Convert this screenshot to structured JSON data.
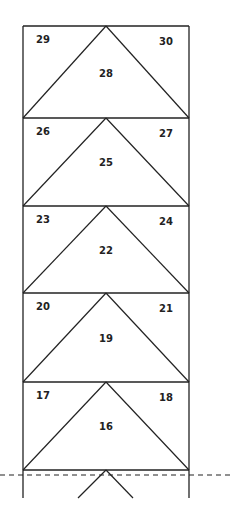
{
  "diagram": {
    "title": "",
    "frame": {
      "left": 23,
      "right": 189,
      "top": 26,
      "bottom_visible": 498,
      "apex_x": 106
    },
    "stroke_color": "#222222",
    "rows": [
      {
        "top": 26,
        "bottom": 118,
        "center_label": "28",
        "left_label": "29",
        "right_label": "30"
      },
      {
        "top": 118,
        "bottom": 206,
        "center_label": "25",
        "left_label": "26",
        "right_label": "27"
      },
      {
        "top": 206,
        "bottom": 293,
        "center_label": "22",
        "left_label": "23",
        "right_label": "24"
      },
      {
        "top": 293,
        "bottom": 382,
        "center_label": "19",
        "left_label": "20",
        "right_label": "21"
      },
      {
        "top": 382,
        "bottom": 470,
        "center_label": "16",
        "left_label": "17",
        "right_label": "18"
      }
    ],
    "cut_line": {
      "y": 475,
      "style": "dashed"
    },
    "partial_next_row": {
      "apex_y": 470,
      "end_y": 498,
      "left_x": 78,
      "right_x": 133
    }
  }
}
